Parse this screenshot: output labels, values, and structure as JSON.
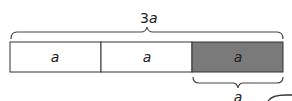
{
  "diagram": {
    "total_label_num": "3",
    "total_label_var": "a",
    "segments": [
      {
        "label": "a",
        "shaded": false
      },
      {
        "label": "a",
        "shaded": false
      },
      {
        "label": "a",
        "shaded": true
      }
    ],
    "bottom_brace_label": "a",
    "colors": {
      "outline": "#333333",
      "shaded_fill": "#7a7a7a",
      "unshaded_fill": "#ffffff"
    }
  }
}
